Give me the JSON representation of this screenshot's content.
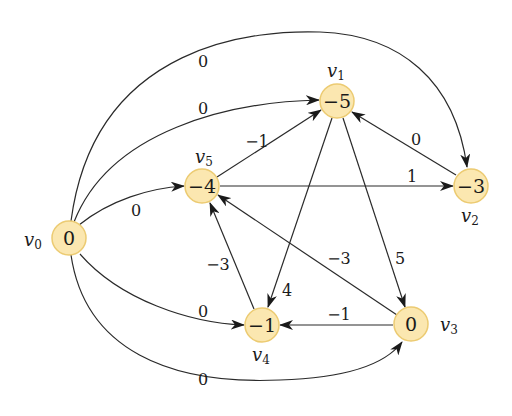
{
  "diagram": {
    "type": "weighted directed graph",
    "colors": {
      "node_fill": "#fbe7b0",
      "node_stroke": "#eccb72",
      "edge": "#2a2a2a"
    },
    "nodes": [
      {
        "id": "v0",
        "name": "v",
        "sub": "0",
        "value": "0"
      },
      {
        "id": "v1",
        "name": "v",
        "sub": "1",
        "value": "−5"
      },
      {
        "id": "v2",
        "name": "v",
        "sub": "2",
        "value": "−3"
      },
      {
        "id": "v3",
        "name": "v",
        "sub": "3",
        "value": "0"
      },
      {
        "id": "v4",
        "name": "v",
        "sub": "4",
        "value": "−1"
      },
      {
        "id": "v5",
        "name": "v",
        "sub": "5",
        "value": "−4"
      }
    ],
    "edges": [
      {
        "from": "v0",
        "to": "v2",
        "weight": "0"
      },
      {
        "from": "v0",
        "to": "v1",
        "weight": "0"
      },
      {
        "from": "v0",
        "to": "v5",
        "weight": "0"
      },
      {
        "from": "v0",
        "to": "v4",
        "weight": "0"
      },
      {
        "from": "v0",
        "to": "v3",
        "weight": "0"
      },
      {
        "from": "v5",
        "to": "v1",
        "weight": "−1"
      },
      {
        "from": "v5",
        "to": "v2",
        "weight": "1"
      },
      {
        "from": "v2",
        "to": "v1",
        "weight": "0"
      },
      {
        "from": "v1",
        "to": "v4",
        "weight": "4"
      },
      {
        "from": "v1",
        "to": "v3",
        "weight": "5"
      },
      {
        "from": "v4",
        "to": "v5",
        "weight": "−3"
      },
      {
        "from": "v3",
        "to": "v5",
        "weight": "−3"
      },
      {
        "from": "v3",
        "to": "v4",
        "weight": "−1"
      }
    ]
  }
}
